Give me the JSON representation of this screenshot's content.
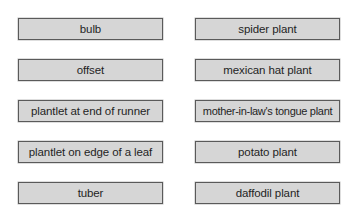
{
  "left_column": {
    "items": [
      {
        "label": "bulb"
      },
      {
        "label": "offset"
      },
      {
        "label": "plantlet at end of runner"
      },
      {
        "label": "plantlet on edge of a leaf"
      },
      {
        "label": "tuber"
      }
    ]
  },
  "right_column": {
    "items": [
      {
        "label": "spider plant"
      },
      {
        "label": "mexican hat plant"
      },
      {
        "label": "mother-in-law's tongue plant"
      },
      {
        "label": "potato plant"
      },
      {
        "label": "daffodil plant"
      }
    ]
  },
  "colors": {
    "box_fill": "#d6d6d6",
    "box_border": "#5a5a5a",
    "text": "#1f1f1f"
  }
}
